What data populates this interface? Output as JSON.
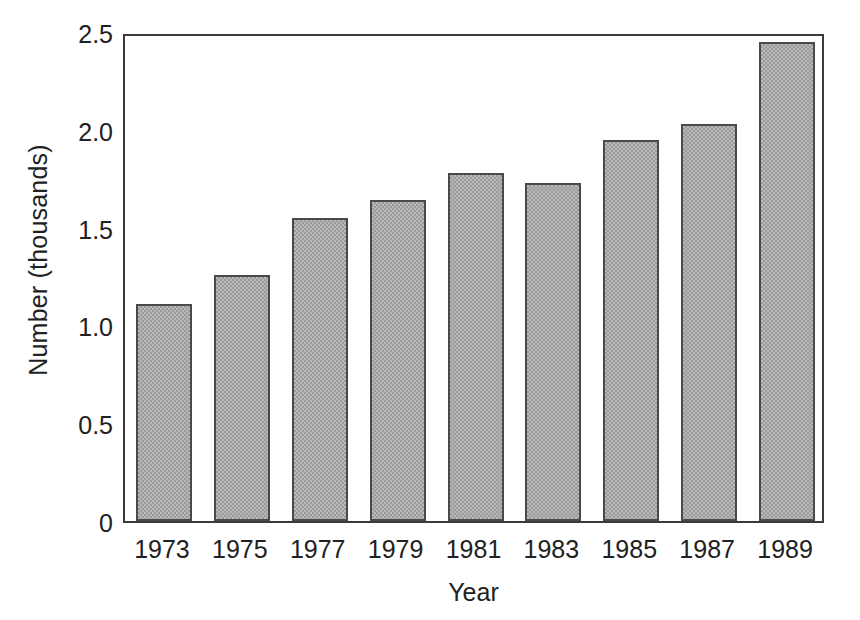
{
  "chart_data": {
    "type": "bar",
    "title": "",
    "xlabel": "Year",
    "ylabel": "Number (thousands)",
    "categories": [
      "1973",
      "1975",
      "1977",
      "1979",
      "1981",
      "1983",
      "1985",
      "1987",
      "1989"
    ],
    "values": [
      1.11,
      1.26,
      1.55,
      1.64,
      1.78,
      1.73,
      1.95,
      2.03,
      2.45
    ],
    "ylim": [
      0,
      2.5
    ],
    "yticks": [
      "0",
      "0.5",
      "1.0",
      "1.5",
      "2.0",
      "2.5"
    ],
    "ytick_values": [
      0,
      0.5,
      1.0,
      1.5,
      2.0,
      2.5
    ],
    "grid": false,
    "legend": null,
    "bar_fill_color": "#b9b9b9",
    "bar_edge_color": "#4a4a4a",
    "axis_color": "#3a3a3a",
    "background_color": "#ffffff"
  }
}
